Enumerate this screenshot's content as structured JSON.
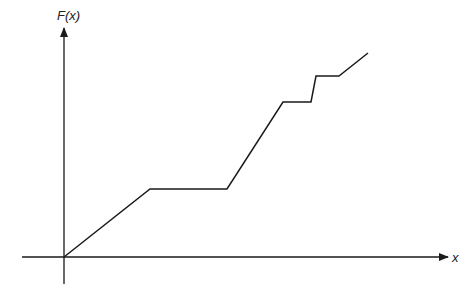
{
  "chart_data": {
    "type": "line",
    "title": "",
    "xlabel": "x",
    "ylabel": "F(x)",
    "grid": false,
    "legend": null,
    "ticks": {
      "x": [],
      "y": []
    },
    "series": [
      {
        "name": "F(x)",
        "description": "Piecewise-linear non-decreasing function starting at origin: rises, flat plateau, steep rise, plateau, vertical-ish jump, plateau, final rise",
        "points_px": [
          [
            64,
            257
          ],
          [
            150,
            189
          ],
          [
            227,
            189
          ],
          [
            283,
            102
          ],
          [
            311,
            102
          ],
          [
            316,
            76
          ],
          [
            339,
            76
          ],
          [
            368,
            53
          ]
        ],
        "x": [
          0,
          86,
          163,
          219,
          247,
          252,
          275,
          304
        ],
        "y": [
          0,
          68,
          68,
          155,
          155,
          181,
          181,
          204
        ]
      }
    ],
    "axes": {
      "origin_px": [
        64,
        257
      ],
      "x_axis_px": {
        "from": 22,
        "to": 448
      },
      "y_axis_px": {
        "from": 284,
        "to": 28
      }
    },
    "color": "#1a1a1a"
  },
  "labels": {
    "y_axis": "F(x)",
    "x_axis": "x"
  }
}
